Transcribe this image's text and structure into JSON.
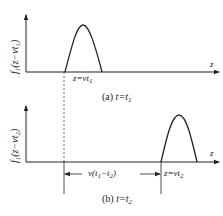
{
  "figure": {
    "panel_a": {
      "y_axis_label_f": "f",
      "y_axis_label_sub": "1",
      "y_axis_label_arg": "(z−vt",
      "y_axis_label_arg_sub": "1",
      "y_axis_label_close": ")",
      "x_axis_label": "z",
      "pulse_position_label": "z=vt",
      "pulse_position_sub": "1",
      "caption_prefix": "(a)",
      "caption_eq": "t=t",
      "caption_sub": "1"
    },
    "panel_b": {
      "y_axis_label_f": "f",
      "y_axis_label_sub": "1",
      "y_axis_label_arg": "(z−vt",
      "y_axis_label_arg_sub": "2",
      "y_axis_label_close": ")",
      "x_axis_label": "z",
      "pulse_position_label": "z=vt",
      "pulse_position_sub": "2",
      "displacement_label": "v(t",
      "displacement_sub1": "1",
      "displacement_mid": "−t",
      "displacement_sub2": "2",
      "displacement_close": ")",
      "caption_prefix": "(b)",
      "caption_eq": "t=t",
      "caption_sub": "2"
    },
    "colors": {
      "line": "#222222",
      "dashed": "#444444",
      "background": "#ffffff"
    }
  }
}
